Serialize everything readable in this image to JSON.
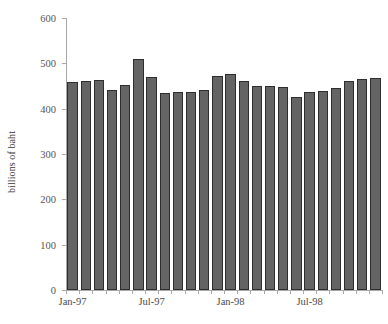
{
  "chart_data": {
    "type": "bar",
    "title": "",
    "subtitle": "",
    "xlabel": "",
    "ylabel": "billions of baht",
    "ylim": [
      0,
      600
    ],
    "ytick_labels": [
      "0",
      "100",
      "200",
      "300",
      "400",
      "500",
      "600"
    ],
    "ytick_values": [
      0,
      100,
      200,
      300,
      400,
      500,
      600
    ],
    "xtick_labels": [
      "Jan-97",
      "Jul-97",
      "Jan-98",
      "Jul-98"
    ],
    "xtick_categories": [
      "Jan-97",
      "Jul-97",
      "Jan-98",
      "Jul-98"
    ],
    "grid": false,
    "legend": false,
    "legend_position": "none",
    "bar_color": "#646464",
    "bar_edge_color": "#2e2e2e",
    "categories": [
      "Jan-97",
      "Feb-97",
      "Mar-97",
      "Apr-97",
      "May-97",
      "Jun-97",
      "Jul-97",
      "Aug-97",
      "Sep-97",
      "Oct-97",
      "Nov-97",
      "Dec-97",
      "Jan-98",
      "Feb-98",
      "Mar-98",
      "Apr-98",
      "May-98",
      "Jun-98",
      "Jul-98",
      "Aug-98",
      "Sep-98",
      "Oct-98",
      "Nov-98",
      "Dec-98"
    ],
    "values": [
      458,
      460,
      464,
      441,
      453,
      510,
      469,
      434,
      437,
      437,
      441,
      471,
      476,
      462,
      450,
      449,
      448,
      425,
      437,
      438,
      446,
      462,
      466,
      468
    ]
  }
}
